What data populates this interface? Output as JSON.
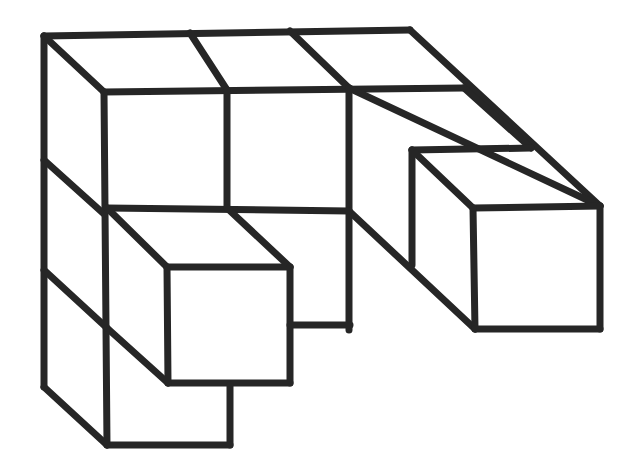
{
  "figure": {
    "stroke_color": "#262626",
    "background": "#ffffff",
    "lines": [
      [
        44,
        36,
        410,
        30
      ],
      [
        410,
        30,
        600,
        206
      ],
      [
        44,
        36,
        44,
        387
      ],
      [
        44,
        36,
        104,
        92
      ],
      [
        104,
        92,
        464,
        88
      ],
      [
        190,
        33,
        227,
        90
      ],
      [
        290,
        31,
        349,
        88
      ],
      [
        349,
        88,
        600,
        206
      ],
      [
        104,
        92,
        107,
        445
      ],
      [
        227,
        90,
        227,
        208
      ],
      [
        349,
        88,
        349,
        330
      ],
      [
        464,
        88,
        531,
        148
      ],
      [
        412,
        150,
        531,
        148
      ],
      [
        412,
        150,
        412,
        265
      ],
      [
        349,
        211,
        475,
        329
      ],
      [
        473,
        208,
        600,
        206
      ],
      [
        473,
        208,
        475,
        329
      ],
      [
        600,
        206,
        600,
        329
      ],
      [
        475,
        329,
        600,
        329
      ],
      [
        412,
        150,
        473,
        208
      ],
      [
        44,
        160,
        104,
        214
      ],
      [
        107,
        208,
        349,
        211
      ],
      [
        107,
        208,
        167,
        267
      ],
      [
        227,
        208,
        290,
        267
      ],
      [
        167,
        267,
        290,
        267
      ],
      [
        167,
        267,
        168,
        383
      ],
      [
        290,
        267,
        290,
        383
      ],
      [
        168,
        383,
        290,
        383
      ],
      [
        290,
        325,
        350,
        325
      ],
      [
        44,
        270,
        107,
        328
      ],
      [
        107,
        328,
        168,
        383
      ],
      [
        230,
        385,
        230,
        445
      ],
      [
        107,
        445,
        230,
        445
      ],
      [
        44,
        387,
        107,
        445
      ]
    ]
  }
}
